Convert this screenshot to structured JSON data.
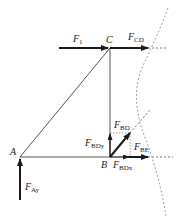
{
  "diagram": {
    "colors": {
      "member": "#555555",
      "force": "#1a1a1a",
      "section_line": "#888888",
      "background": "#ffffff"
    },
    "nodes": [
      {
        "id": "A",
        "label": "A"
      },
      {
        "id": "B",
        "label": "B"
      },
      {
        "id": "C",
        "label": "C"
      }
    ],
    "members": [
      {
        "from": "A",
        "to": "B"
      },
      {
        "from": "A",
        "to": "C"
      },
      {
        "from": "B",
        "to": "C"
      }
    ],
    "forces": {
      "F1": {
        "main": "F",
        "sub": "1"
      },
      "FCD": {
        "main": "F",
        "sub": "CD"
      },
      "FAy": {
        "main": "F",
        "sub": "Ay"
      },
      "FBD": {
        "main": "F",
        "sub": "BD"
      },
      "FBDy": {
        "main": "F",
        "sub": "BDy"
      },
      "FBDx": {
        "main": "F",
        "sub": "BDx"
      },
      "FBE": {
        "main": "F",
        "sub": "BE"
      }
    },
    "section_cut": "dashed curve"
  }
}
